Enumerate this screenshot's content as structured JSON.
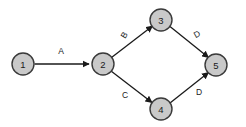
{
  "diagram": {
    "type": "directed-graph",
    "title": "",
    "background_color": "#ffffff",
    "node_fill_color": "#c9c9c9",
    "node_stroke_color": "#3a3a3a",
    "edge_color": "#1a1a1a",
    "label_color": "#1a1a1a",
    "nodes": [
      {
        "id": "1",
        "label": "1",
        "cx": 23,
        "cy": 64,
        "r": 11
      },
      {
        "id": "2",
        "label": "2",
        "cx": 103,
        "cy": 64,
        "r": 11
      },
      {
        "id": "3",
        "label": "3",
        "cx": 161,
        "cy": 20,
        "r": 11
      },
      {
        "id": "4",
        "label": "4",
        "cx": 161,
        "cy": 109,
        "r": 11
      },
      {
        "id": "5",
        "label": "5",
        "cx": 216,
        "cy": 65,
        "r": 11
      }
    ],
    "edges": [
      {
        "id": "e1",
        "from": "1",
        "to": "2",
        "label": "A",
        "label_x": 61,
        "label_y": 51,
        "label_rotation": 0
      },
      {
        "id": "e2",
        "from": "2",
        "to": "3",
        "label": "B",
        "label_x": 124,
        "label_y": 35,
        "label_rotation": 300
      },
      {
        "id": "e3",
        "from": "2",
        "to": "4",
        "label": "C",
        "label_x": 125,
        "label_y": 95,
        "label_rotation": 0
      },
      {
        "id": "e4",
        "from": "3",
        "to": "5",
        "label": "D",
        "label_x": 197,
        "label_y": 34,
        "label_rotation": 330
      },
      {
        "id": "e5",
        "from": "4",
        "to": "5",
        "label": "D",
        "label_x": 199,
        "label_y": 92,
        "label_rotation": 0
      }
    ]
  }
}
